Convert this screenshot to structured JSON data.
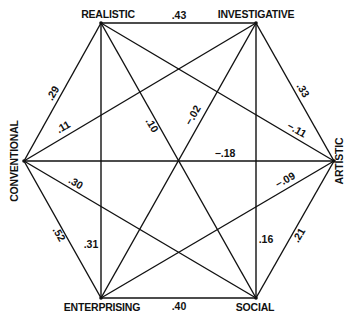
{
  "nodes": {
    "realistic": "REALISTIC",
    "investigative": "INVESTIGATIVE",
    "artistic": "ARTISTIC",
    "social": "SOCIAL",
    "enterprising": "ENTERPRISING",
    "conventional": "CONVENTIONAL"
  },
  "correlations": {
    "realistic_investigative": ".43",
    "investigative_artistic": ".33",
    "artistic_social": ".21",
    "social_enterprising": ".40",
    "enterprising_conventional": ".52",
    "conventional_realistic": ".29",
    "realistic_artistic": "−.11",
    "realistic_social": ".10",
    "realistic_enterprising": ".31",
    "investigative_social": ".16",
    "investigative_enterprising": "−.02",
    "investigative_conventional": ".11",
    "artistic_conventional": "−.18",
    "artistic_enterprising": "−.09",
    "social_conventional": ".30"
  }
}
